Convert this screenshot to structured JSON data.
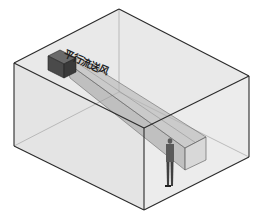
{
  "diagram": {
    "title_label": "平行流送风",
    "label_position": {
      "x": 68,
      "y": 45,
      "rotate": 24
    },
    "colors": {
      "background": "#ffffff",
      "room_fill": "#e9e9e9",
      "room_edge": "#2a2a2a",
      "hidden_edge": "#9a9a9a",
      "beam_fill": "#9c9c9c",
      "beam_edge": "#555555",
      "device_fill": "#4a4a4a",
      "person_fill": "#5a5a5a"
    },
    "room": {
      "top_back": [
        119,
        9
      ],
      "top_left": [
        14,
        63
      ],
      "top_front": [
        144,
        128
      ],
      "top_right": [
        249,
        76
      ],
      "bottom_left": [
        14,
        146
      ],
      "bottom_front": [
        144,
        210
      ],
      "bottom_right": [
        249,
        157
      ],
      "bottom_back": [
        119,
        92
      ]
    },
    "device": {
      "name": "parallel-flow-air-supply-unit",
      "top": [
        [
          48,
          56
        ],
        [
          60,
          50
        ],
        [
          76,
          58
        ],
        [
          64,
          64
        ]
      ],
      "front": [
        [
          64,
          64
        ],
        [
          76,
          58
        ],
        [
          76,
          72
        ],
        [
          64,
          78
        ]
      ],
      "side": [
        [
          48,
          56
        ],
        [
          64,
          64
        ],
        [
          64,
          78
        ],
        [
          48,
          70
        ]
      ]
    },
    "air_beam": {
      "top": [
        [
          66,
          62
        ],
        [
          80,
          58
        ],
        [
          206,
          137
        ],
        [
          185,
          148
        ]
      ],
      "front": [
        [
          66,
          62
        ],
        [
          185,
          148
        ],
        [
          185,
          170
        ],
        [
          70,
          78
        ]
      ],
      "end": [
        [
          185,
          148
        ],
        [
          206,
          137
        ],
        [
          206,
          160
        ],
        [
          185,
          170
        ]
      ]
    },
    "person": {
      "head": [
        170,
        141
      ],
      "feet_y": 186
    }
  }
}
